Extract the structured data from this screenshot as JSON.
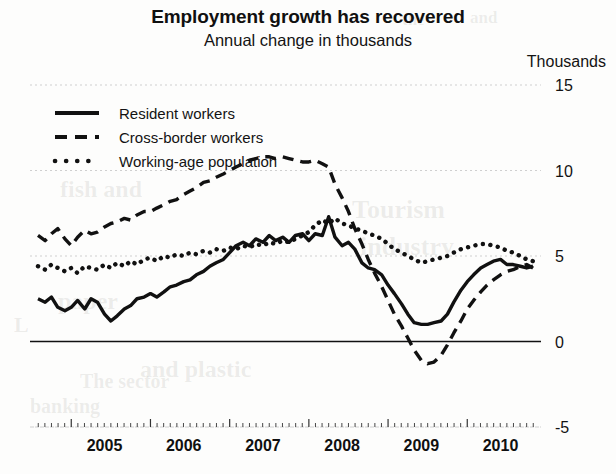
{
  "title": "Employment growth has recovered",
  "subtitle": "Annual change in thousands",
  "axis_unit": "Thousands",
  "legend": [
    {
      "label": "Resident workers",
      "style": "solid"
    },
    {
      "label": "Cross-border workers",
      "style": "dashed"
    },
    {
      "label": "Working-age population",
      "style": "dotted"
    }
  ],
  "ticks": {
    "y": [
      "15",
      "10",
      "5",
      "0",
      "-5"
    ],
    "x": [
      "2005",
      "2006",
      "2007",
      "2008",
      "2009",
      "2010"
    ]
  },
  "colors": {
    "line": "#111111",
    "grid": "#cfcfcf",
    "zero_axis": "#111111",
    "text": "#131313",
    "background": "#fdfdfc"
  },
  "bleed_text": [
    {
      "text": "the",
      "x": 402,
      "y": 10,
      "size": 17
    },
    {
      "text": "and",
      "x": 470,
      "y": 8,
      "size": 17
    },
    {
      "text": "Tourism",
      "x": 352,
      "y": 195,
      "size": 26
    },
    {
      "text": "industry",
      "x": 360,
      "y": 232,
      "size": 26
    },
    {
      "text": "fish and",
      "x": 60,
      "y": 176,
      "size": 24
    },
    {
      "text": "paper",
      "x": 58,
      "y": 288,
      "size": 24
    },
    {
      "text": "and plastic",
      "x": 140,
      "y": 356,
      "size": 24
    },
    {
      "text": "The sector",
      "x": 80,
      "y": 370,
      "size": 20
    },
    {
      "text": "banking",
      "x": 30,
      "y": 395,
      "size": 20
    },
    {
      "text": "L",
      "x": 14,
      "y": 312,
      "size": 22
    }
  ],
  "chart_data": {
    "type": "line",
    "title": "Employment growth has recovered",
    "subtitle": "Annual change in thousands",
    "xlabel": "",
    "ylabel": "Thousands",
    "xlim": [
      2004.58,
      2010.83
    ],
    "ylim": [
      -5,
      15
    ],
    "yticks": [
      -5,
      0,
      5,
      10,
      15
    ],
    "grid": true,
    "grid_values": [
      15,
      10,
      5,
      -5
    ],
    "zero_line": 0,
    "legend_position": "top-left",
    "x": [
      2004.58,
      2004.67,
      2004.75,
      2004.83,
      2004.92,
      2005.0,
      2005.08,
      2005.17,
      2005.25,
      2005.33,
      2005.42,
      2005.5,
      2005.58,
      2005.67,
      2005.75,
      2005.83,
      2005.92,
      2006.0,
      2006.08,
      2006.17,
      2006.25,
      2006.33,
      2006.42,
      2006.5,
      2006.58,
      2006.67,
      2006.75,
      2006.83,
      2006.92,
      2007.0,
      2007.08,
      2007.17,
      2007.25,
      2007.33,
      2007.42,
      2007.5,
      2007.58,
      2007.67,
      2007.75,
      2007.83,
      2007.92,
      2008.0,
      2008.08,
      2008.17,
      2008.25,
      2008.33,
      2008.42,
      2008.5,
      2008.58,
      2008.67,
      2008.75,
      2008.83,
      2008.92,
      2009.0,
      2009.08,
      2009.17,
      2009.25,
      2009.33,
      2009.42,
      2009.5,
      2009.58,
      2009.67,
      2009.75,
      2009.83,
      2009.92,
      2010.0,
      2010.08,
      2010.17,
      2010.25,
      2010.33,
      2010.42,
      2010.5,
      2010.58,
      2010.67,
      2010.75,
      2010.83
    ],
    "series": [
      {
        "name": "Resident workers",
        "style": "solid",
        "values": [
          2.5,
          2.3,
          2.6,
          2.0,
          1.8,
          2.0,
          2.4,
          1.9,
          2.5,
          2.3,
          1.6,
          1.2,
          1.5,
          1.9,
          2.1,
          2.5,
          2.6,
          2.8,
          2.6,
          2.9,
          3.2,
          3.3,
          3.5,
          3.6,
          3.9,
          4.1,
          4.4,
          4.6,
          4.8,
          5.2,
          5.6,
          5.8,
          5.6,
          6.0,
          5.8,
          6.2,
          5.9,
          6.1,
          5.8,
          6.2,
          6.3,
          5.9,
          6.3,
          6.2,
          7.3,
          6.1,
          5.6,
          5.8,
          5.4,
          4.6,
          4.3,
          4.2,
          3.9,
          3.3,
          2.8,
          2.2,
          1.6,
          1.1,
          1.0,
          1.0,
          1.1,
          1.2,
          1.6,
          2.3,
          3.0,
          3.5,
          3.9,
          4.3,
          4.5,
          4.7,
          4.8,
          4.5,
          4.5,
          4.4,
          4.3,
          4.4
        ]
      },
      {
        "name": "Cross-border workers",
        "style": "dashed",
        "values": [
          6.2,
          5.9,
          6.3,
          6.6,
          6.0,
          5.6,
          6.1,
          6.5,
          6.3,
          6.4,
          6.7,
          6.9,
          7.0,
          7.2,
          7.1,
          7.4,
          7.6,
          7.6,
          7.8,
          8.0,
          8.2,
          8.3,
          8.6,
          8.8,
          9.0,
          9.3,
          9.4,
          9.6,
          9.8,
          10.0,
          10.2,
          10.4,
          10.6,
          10.7,
          10.8,
          10.8,
          10.7,
          10.8,
          10.7,
          10.6,
          10.5,
          10.5,
          10.6,
          10.4,
          10.2,
          9.2,
          8.4,
          7.6,
          6.6,
          5.7,
          4.8,
          4.0,
          3.2,
          2.4,
          1.6,
          0.9,
          0.2,
          -0.5,
          -1.1,
          -1.3,
          -1.2,
          -0.8,
          -0.2,
          0.5,
          1.2,
          1.9,
          2.4,
          2.9,
          3.3,
          3.6,
          3.9,
          4.1,
          4.2,
          4.4,
          4.5,
          4.3
        ]
      },
      {
        "name": "Working-age population",
        "style": "dotted",
        "values": [
          4.4,
          4.2,
          4.5,
          4.3,
          4.1,
          4.3,
          4.0,
          4.4,
          4.3,
          4.2,
          4.5,
          4.3,
          4.6,
          4.4,
          4.7,
          4.5,
          4.8,
          4.9,
          4.7,
          5.0,
          4.9,
          5.1,
          5.0,
          5.2,
          5.1,
          5.3,
          5.2,
          5.4,
          5.3,
          5.5,
          5.4,
          5.6,
          5.5,
          5.7,
          5.6,
          5.8,
          5.7,
          5.9,
          5.8,
          6.0,
          6.2,
          6.4,
          6.8,
          7.1,
          6.9,
          7.2,
          6.9,
          6.8,
          6.6,
          6.5,
          6.3,
          6.2,
          6.0,
          5.7,
          5.4,
          5.2,
          5.0,
          4.8,
          4.6,
          4.7,
          4.8,
          4.9,
          5.0,
          5.2,
          5.4,
          5.5,
          5.6,
          5.7,
          5.7,
          5.6,
          5.5,
          5.3,
          5.2,
          5.0,
          4.8,
          4.7
        ]
      }
    ]
  }
}
